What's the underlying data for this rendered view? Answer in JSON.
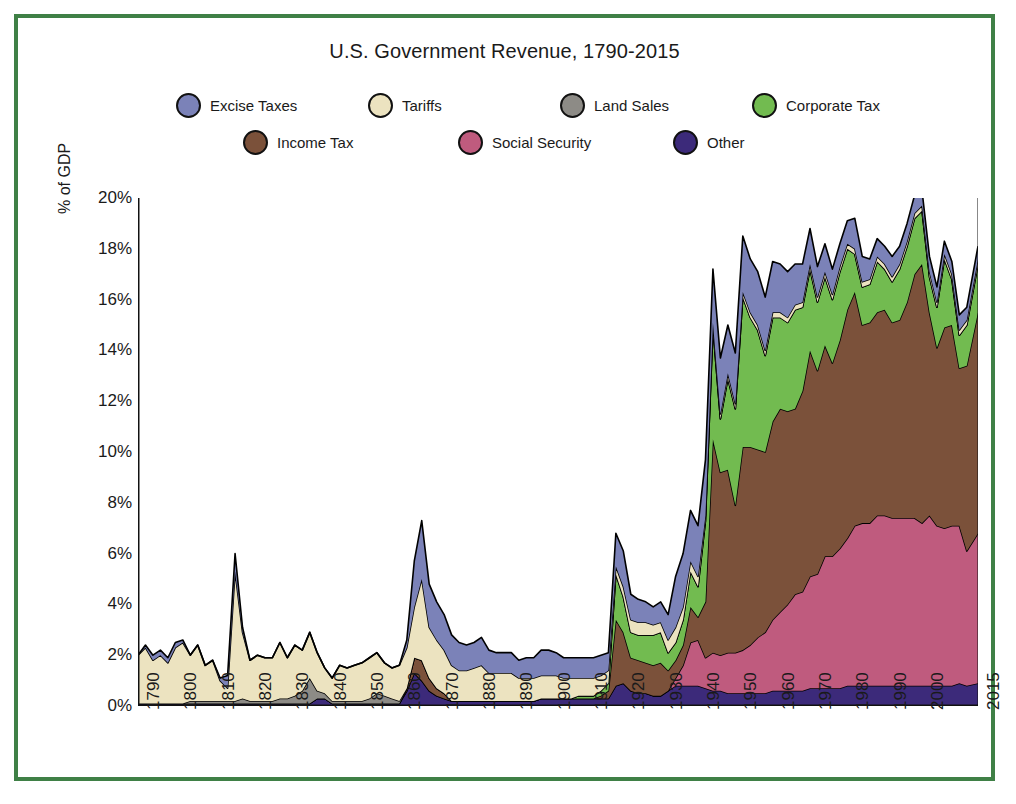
{
  "figure": {
    "border_color": "#3f8046",
    "background": "#ffffff"
  },
  "chart_data": {
    "type": "area",
    "stacked": true,
    "title": "U.S. Government Revenue, 1790-2015",
    "xlabel": "",
    "ylabel": "% of GDP",
    "xlim": [
      1790,
      2015
    ],
    "ylim": [
      0,
      20
    ],
    "grid": false,
    "legend_position": "top",
    "ytick_labels": [
      "0%",
      "2%",
      "4%",
      "6%",
      "8%",
      "10%",
      "12%",
      "14%",
      "16%",
      "18%",
      "20%"
    ],
    "ytick_values": [
      0,
      2,
      4,
      6,
      8,
      10,
      12,
      14,
      16,
      18,
      20
    ],
    "xtick_labels": [
      "1790",
      "1800",
      "1810",
      "1820",
      "1830",
      "1840",
      "1850",
      "1860",
      "1870",
      "1880",
      "1890",
      "1900",
      "1910",
      "1920",
      "1930",
      "1940",
      "1950",
      "1960",
      "1970",
      "1980",
      "1990",
      "2000",
      "2015"
    ],
    "xtick_values": [
      1790,
      1800,
      1810,
      1820,
      1830,
      1840,
      1850,
      1860,
      1870,
      1880,
      1890,
      1900,
      1910,
      1920,
      1930,
      1940,
      1950,
      1960,
      1970,
      1980,
      1990,
      2000,
      2015
    ],
    "stack_order_bottom_to_top": [
      "Other",
      "Social Security",
      "Income Tax",
      "Corporate Tax",
      "Land Sales",
      "Tariffs",
      "Excise Taxes"
    ],
    "colors": {
      "Excise Taxes": "#7b82b8",
      "Tariffs": "#ece3c0",
      "Land Sales": "#8d8b86",
      "Corporate Tax": "#72bb50",
      "Income Tax": "#7b513a",
      "Social Security": "#bf5b7e",
      "Other": "#3c2a7a"
    },
    "x": [
      1790,
      1792,
      1794,
      1796,
      1798,
      1800,
      1802,
      1804,
      1806,
      1808,
      1810,
      1812,
      1814,
      1816,
      1818,
      1820,
      1822,
      1824,
      1826,
      1828,
      1830,
      1832,
      1834,
      1836,
      1838,
      1840,
      1842,
      1844,
      1846,
      1848,
      1850,
      1852,
      1854,
      1856,
      1858,
      1860,
      1862,
      1864,
      1866,
      1868,
      1870,
      1872,
      1874,
      1876,
      1878,
      1880,
      1882,
      1884,
      1886,
      1888,
      1890,
      1892,
      1894,
      1896,
      1898,
      1900,
      1902,
      1904,
      1906,
      1908,
      1910,
      1912,
      1914,
      1916,
      1918,
      1920,
      1922,
      1924,
      1926,
      1928,
      1930,
      1932,
      1934,
      1936,
      1938,
      1940,
      1942,
      1944,
      1946,
      1948,
      1950,
      1952,
      1954,
      1956,
      1958,
      1960,
      1962,
      1964,
      1966,
      1968,
      1970,
      1972,
      1974,
      1976,
      1978,
      1980,
      1982,
      1984,
      1986,
      1988,
      1990,
      1992,
      1994,
      1996,
      1998,
      2000,
      2002,
      2004,
      2006,
      2008,
      2010,
      2012,
      2015
    ],
    "series": [
      {
        "name": "Excise Taxes",
        "values": [
          0.0,
          0.1,
          0.2,
          0.2,
          0.2,
          0.2,
          0.1,
          0.0,
          0.0,
          0.0,
          0.0,
          0.1,
          0.5,
          0.7,
          0.2,
          0.0,
          0.0,
          0.0,
          0.0,
          0.0,
          0.0,
          0.0,
          0.0,
          0.0,
          0.0,
          0.0,
          0.0,
          0.0,
          0.0,
          0.0,
          0.0,
          0.0,
          0.0,
          0.0,
          0.0,
          0.0,
          0.3,
          1.8,
          2.3,
          1.7,
          1.5,
          1.4,
          1.2,
          1.1,
          1.0,
          1.0,
          1.1,
          0.9,
          0.8,
          0.8,
          0.8,
          0.7,
          0.8,
          0.8,
          1.0,
          1.0,
          0.9,
          0.8,
          0.8,
          0.8,
          0.8,
          0.8,
          0.8,
          0.7,
          1.3,
          1.4,
          1.0,
          0.9,
          0.8,
          0.7,
          0.8,
          1.0,
          2.0,
          2.1,
          2.0,
          2.0,
          2.2,
          2.1,
          2.2,
          1.9,
          2.0,
          2.2,
          2.1,
          2.1,
          2.1,
          2.0,
          1.9,
          1.8,
          1.6,
          1.5,
          1.4,
          1.2,
          1.1,
          1.0,
          0.9,
          0.9,
          1.2,
          1.0,
          0.8,
          0.7,
          0.7,
          0.8,
          0.7,
          0.7,
          0.7,
          0.6,
          0.6,
          0.6,
          0.5,
          0.5,
          0.6,
          0.5,
          0.5
        ]
      },
      {
        "name": "Tariffs",
        "values": [
          1.9,
          2.2,
          1.7,
          1.9,
          1.6,
          2.2,
          2.4,
          1.8,
          2.2,
          1.4,
          1.6,
          0.8,
          0.5,
          5.1,
          2.6,
          1.6,
          1.8,
          1.7,
          1.7,
          2.2,
          1.6,
          2.0,
          1.6,
          1.8,
          1.5,
          1.0,
          0.9,
          1.4,
          1.3,
          1.4,
          1.5,
          1.6,
          1.6,
          1.3,
          1.2,
          1.4,
          1.6,
          2.0,
          3.2,
          2.0,
          1.9,
          1.7,
          1.4,
          1.2,
          1.2,
          1.3,
          1.4,
          1.1,
          1.1,
          1.1,
          1.1,
          0.9,
          0.9,
          0.9,
          0.9,
          0.9,
          0.9,
          0.8,
          0.8,
          0.7,
          0.7,
          0.7,
          0.6,
          0.5,
          0.3,
          0.4,
          0.5,
          0.5,
          0.5,
          0.4,
          0.4,
          0.5,
          0.6,
          0.5,
          0.4,
          0.4,
          0.2,
          0.2,
          0.2,
          0.2,
          0.2,
          0.2,
          0.2,
          0.2,
          0.2,
          0.2,
          0.2,
          0.2,
          0.2,
          0.2,
          0.2,
          0.2,
          0.2,
          0.2,
          0.2,
          0.2,
          0.2,
          0.2,
          0.2,
          0.2,
          0.2,
          0.2,
          0.2,
          0.2,
          0.2,
          0.2,
          0.2,
          0.2,
          0.2,
          0.2,
          0.2,
          0.2,
          0.2
        ]
      },
      {
        "name": "Land Sales",
        "values": [
          0.0,
          0.0,
          0.0,
          0.0,
          0.0,
          0.0,
          0.0,
          0.1,
          0.1,
          0.1,
          0.1,
          0.1,
          0.1,
          0.1,
          0.2,
          0.1,
          0.1,
          0.1,
          0.1,
          0.2,
          0.2,
          0.3,
          0.5,
          1.0,
          0.3,
          0.2,
          0.1,
          0.1,
          0.1,
          0.1,
          0.1,
          0.2,
          0.4,
          0.3,
          0.2,
          0.1,
          0.0,
          0.0,
          0.0,
          0.0,
          0.0,
          0.0,
          0.0,
          0.0,
          0.0,
          0.0,
          0.0,
          0.0,
          0.0,
          0.0,
          0.0,
          0.0,
          0.0,
          0.0,
          0.0,
          0.0,
          0.0,
          0.0,
          0.0,
          0.0,
          0.0,
          0.0,
          0.0,
          0.0,
          0.0,
          0.0,
          0.0,
          0.0,
          0.0,
          0.0,
          0.0,
          0.0,
          0.0,
          0.0,
          0.0,
          0.0,
          0.0,
          0.0,
          0.0,
          0.0,
          0.0,
          0.0,
          0.0,
          0.0,
          0.0,
          0.0,
          0.0,
          0.0,
          0.0,
          0.0,
          0.0,
          0.0,
          0.0,
          0.0,
          0.0,
          0.0,
          0.0,
          0.0,
          0.0,
          0.0,
          0.0,
          0.0,
          0.0,
          0.0,
          0.0,
          0.0,
          0.0,
          0.0,
          0.0,
          0.0,
          0.0,
          0.0,
          0.0
        ]
      },
      {
        "name": "Corporate Tax",
        "values": [
          0.0,
          0.0,
          0.0,
          0.0,
          0.0,
          0.0,
          0.0,
          0.0,
          0.0,
          0.0,
          0.0,
          0.0,
          0.0,
          0.0,
          0.0,
          0.0,
          0.0,
          0.0,
          0.0,
          0.0,
          0.0,
          0.0,
          0.0,
          0.0,
          0.0,
          0.0,
          0.0,
          0.0,
          0.0,
          0.0,
          0.0,
          0.0,
          0.0,
          0.0,
          0.0,
          0.0,
          0.0,
          0.0,
          0.0,
          0.0,
          0.0,
          0.0,
          0.0,
          0.0,
          0.0,
          0.0,
          0.0,
          0.0,
          0.0,
          0.0,
          0.0,
          0.0,
          0.0,
          0.0,
          0.0,
          0.0,
          0.0,
          0.0,
          0.0,
          0.1,
          0.1,
          0.1,
          0.2,
          0.3,
          1.8,
          1.4,
          1.0,
          1.0,
          1.1,
          1.2,
          1.2,
          0.7,
          0.7,
          1.0,
          1.4,
          1.2,
          3.2,
          4.4,
          2.1,
          3.6,
          3.8,
          5.9,
          5.1,
          4.7,
          3.8,
          4.1,
          3.6,
          3.5,
          3.9,
          3.3,
          3.2,
          2.7,
          2.7,
          2.5,
          2.7,
          2.4,
          1.5,
          1.5,
          1.5,
          2.0,
          1.6,
          1.6,
          2.0,
          2.2,
          2.2,
          2.1,
          1.4,
          1.6,
          2.7,
          1.8,
          1.3,
          1.6,
          1.9
        ]
      },
      {
        "name": "Income Tax",
        "values": [
          0.0,
          0.0,
          0.0,
          0.0,
          0.0,
          0.0,
          0.0,
          0.0,
          0.0,
          0.0,
          0.0,
          0.0,
          0.0,
          0.0,
          0.0,
          0.0,
          0.0,
          0.0,
          0.0,
          0.0,
          0.0,
          0.0,
          0.0,
          0.0,
          0.0,
          0.0,
          0.0,
          0.0,
          0.0,
          0.0,
          0.0,
          0.0,
          0.0,
          0.0,
          0.0,
          0.0,
          0.1,
          0.6,
          0.8,
          0.5,
          0.3,
          0.2,
          0.0,
          0.0,
          0.0,
          0.0,
          0.0,
          0.0,
          0.0,
          0.0,
          0.0,
          0.0,
          0.0,
          0.0,
          0.0,
          0.0,
          0.0,
          0.0,
          0.0,
          0.0,
          0.0,
          0.0,
          0.1,
          0.3,
          2.6,
          2.0,
          1.3,
          1.3,
          1.2,
          1.2,
          1.3,
          0.8,
          0.7,
          0.8,
          1.4,
          0.9,
          2.2,
          8.4,
          7.2,
          7.2,
          5.8,
          8.0,
          7.8,
          7.4,
          7.1,
          7.8,
          8.0,
          7.6,
          7.3,
          7.9,
          8.9,
          8.0,
          8.3,
          7.6,
          8.2,
          9.0,
          9.2,
          7.8,
          7.9,
          8.0,
          8.1,
          7.7,
          7.8,
          8.5,
          9.6,
          10.2,
          8.0,
          7.0,
          7.9,
          7.9,
          6.2,
          7.3,
          8.7
        ]
      },
      {
        "name": "Social Security",
        "values": [
          0.0,
          0.0,
          0.0,
          0.0,
          0.0,
          0.0,
          0.0,
          0.0,
          0.0,
          0.0,
          0.0,
          0.0,
          0.0,
          0.0,
          0.0,
          0.0,
          0.0,
          0.0,
          0.0,
          0.0,
          0.0,
          0.0,
          0.0,
          0.0,
          0.0,
          0.0,
          0.0,
          0.0,
          0.0,
          0.0,
          0.0,
          0.0,
          0.0,
          0.0,
          0.0,
          0.0,
          0.0,
          0.0,
          0.0,
          0.0,
          0.0,
          0.0,
          0.0,
          0.0,
          0.0,
          0.0,
          0.0,
          0.0,
          0.0,
          0.0,
          0.0,
          0.0,
          0.0,
          0.0,
          0.0,
          0.0,
          0.0,
          0.0,
          0.0,
          0.0,
          0.0,
          0.0,
          0.0,
          0.0,
          0.0,
          0.0,
          0.0,
          0.0,
          0.0,
          0.0,
          0.0,
          0.0,
          0.3,
          0.8,
          1.7,
          1.8,
          1.2,
          1.5,
          1.4,
          1.6,
          1.6,
          1.7,
          1.9,
          2.2,
          2.4,
          2.8,
          3.1,
          3.4,
          3.8,
          3.9,
          4.4,
          4.5,
          5.2,
          5.2,
          5.5,
          5.8,
          6.3,
          6.4,
          6.4,
          6.7,
          6.7,
          6.6,
          6.6,
          6.6,
          6.6,
          6.4,
          6.7,
          6.3,
          6.2,
          6.3,
          6.2,
          5.3,
          5.9
        ]
      },
      {
        "name": "Other",
        "values": [
          0.1,
          0.1,
          0.1,
          0.1,
          0.1,
          0.1,
          0.1,
          0.1,
          0.1,
          0.1,
          0.1,
          0.1,
          0.1,
          0.1,
          0.1,
          0.1,
          0.1,
          0.1,
          0.1,
          0.1,
          0.1,
          0.1,
          0.1,
          0.1,
          0.3,
          0.3,
          0.1,
          0.1,
          0.1,
          0.1,
          0.1,
          0.1,
          0.1,
          0.1,
          0.1,
          0.1,
          0.6,
          1.3,
          1.0,
          0.6,
          0.4,
          0.3,
          0.2,
          0.2,
          0.2,
          0.2,
          0.2,
          0.2,
          0.2,
          0.2,
          0.2,
          0.2,
          0.2,
          0.2,
          0.3,
          0.3,
          0.3,
          0.3,
          0.3,
          0.3,
          0.3,
          0.3,
          0.3,
          0.3,
          0.8,
          0.9,
          0.6,
          0.5,
          0.5,
          0.4,
          0.4,
          0.6,
          0.8,
          0.8,
          0.8,
          0.8,
          0.7,
          0.6,
          0.6,
          0.5,
          0.5,
          0.5,
          0.5,
          0.5,
          0.5,
          0.6,
          0.6,
          0.6,
          0.6,
          0.6,
          0.7,
          0.7,
          0.7,
          0.7,
          0.7,
          0.8,
          0.8,
          0.8,
          0.8,
          0.8,
          0.8,
          0.8,
          0.8,
          0.8,
          0.8,
          0.8,
          0.8,
          0.8,
          0.8,
          0.8,
          0.9,
          0.8,
          0.9
        ]
      }
    ]
  },
  "legend": {
    "row1": [
      {
        "label": "Excise Taxes",
        "color": "#7b82b8"
      },
      {
        "label": "Tariffs",
        "color": "#ece3c0"
      },
      {
        "label": "Land Sales",
        "color": "#8d8b86"
      },
      {
        "label": "Corporate Tax",
        "color": "#72bb50"
      }
    ],
    "row2": [
      {
        "label": "Income Tax",
        "color": "#7b513a"
      },
      {
        "label": "Social Security",
        "color": "#bf5b7e"
      },
      {
        "label": "Other",
        "color": "#3c2a7a"
      }
    ]
  }
}
